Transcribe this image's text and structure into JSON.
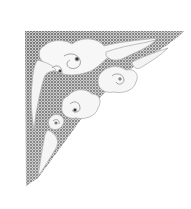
{
  "artwork": {
    "subject": "auspicious cloud corner ornament",
    "style": "grayscale stippled engraving",
    "orientation": "top-left corner",
    "colors": {
      "background": "#ffffff",
      "shade_dark": "#5a5a5a",
      "shade_mid": "#9a9a9a",
      "cloud_fill": "#f7f7f7",
      "outline": "#b5b5b5",
      "eye": "#333333"
    }
  }
}
